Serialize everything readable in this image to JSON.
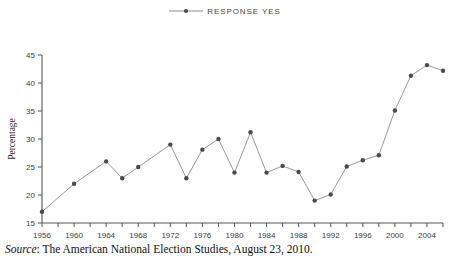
{
  "legend": {
    "marker_icon": "line-with-dot-marker-icon",
    "entries": [
      {
        "label": "RESPONSE YES",
        "color": "#8e8e93",
        "marker_color": "#4a4a4f"
      }
    ]
  },
  "axes": {
    "y_title": "Percentage",
    "y_ticks": [
      "15",
      "20",
      "25",
      "30",
      "35",
      "40",
      "45"
    ],
    "x_ticks": [
      "1956",
      "1960",
      "1964",
      "1968",
      "1972",
      "1976",
      "1980",
      "1984",
      "1988",
      "1992",
      "1996",
      "2000",
      "2004"
    ]
  },
  "caption": {
    "source_word": "Source",
    "source_sep": ":",
    "source_text": " The American National Election Studies, August 23, 2010."
  },
  "colors": {
    "line": "#8e8e93",
    "marker": "#4a4a4f",
    "axis": "#55565a",
    "background": "#ffffff"
  },
  "chart_data": {
    "type": "line",
    "title": "",
    "subtitle": "",
    "xlabel": "",
    "ylabel": "Percentage",
    "xlim": [
      1956,
      2006
    ],
    "ylim": [
      15,
      45
    ],
    "ytick_step": 5,
    "xtick_step": 2,
    "xlabel_step": 4,
    "grid": false,
    "legend_position": "top-center",
    "x": [
      1956,
      1958,
      1960,
      1962,
      1964,
      1966,
      1968,
      1970,
      1972,
      1974,
      1976,
      1978,
      1980,
      1982,
      1984,
      1986,
      1988,
      1990,
      1992,
      1994,
      1996,
      1998,
      2000,
      2002,
      2004,
      2006
    ],
    "series": [
      {
        "name": "RESPONSE YES",
        "marker": "circle",
        "values": [
          17,
          null,
          22,
          null,
          26,
          23,
          25,
          null,
          29,
          23,
          28.1,
          30,
          24,
          31.2,
          24,
          25.2,
          24.1,
          19,
          20.1,
          25.1,
          26.2,
          27.1,
          35.1,
          41.3,
          43.2,
          42.2
        ]
      }
    ],
    "points": [
      {
        "x": 1956,
        "y": 17
      },
      {
        "x": 1960,
        "y": 22
      },
      {
        "x": 1964,
        "y": 26
      },
      {
        "x": 1966,
        "y": 23
      },
      {
        "x": 1968,
        "y": 25
      },
      {
        "x": 1972,
        "y": 29
      },
      {
        "x": 1974,
        "y": 23
      },
      {
        "x": 1976,
        "y": 28.1
      },
      {
        "x": 1978,
        "y": 30
      },
      {
        "x": 1980,
        "y": 24
      },
      {
        "x": 1982,
        "y": 31.2
      },
      {
        "x": 1984,
        "y": 24
      },
      {
        "x": 1986,
        "y": 25.2
      },
      {
        "x": 1988,
        "y": 24.1
      },
      {
        "x": 1990,
        "y": 19
      },
      {
        "x": 1992,
        "y": 20.1
      },
      {
        "x": 1994,
        "y": 25.1
      },
      {
        "x": 1996,
        "y": 26.2
      },
      {
        "x": 1998,
        "y": 27.1
      },
      {
        "x": 2000,
        "y": 35.1
      },
      {
        "x": 2002,
        "y": 41.3
      },
      {
        "x": 2004,
        "y": 43.2
      },
      {
        "x": 2006,
        "y": 42.2
      }
    ]
  }
}
